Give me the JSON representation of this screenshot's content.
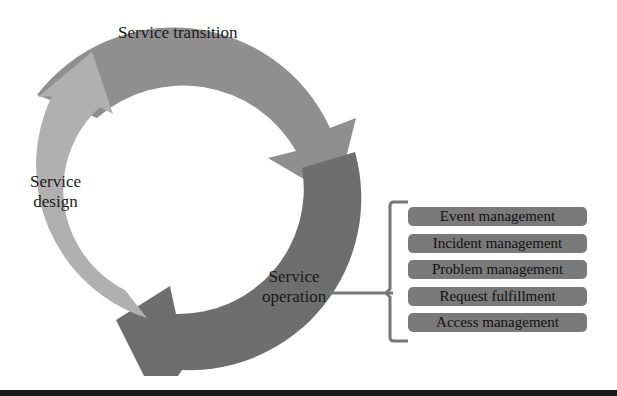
{
  "diagram": {
    "stages": [
      {
        "id": "service-transition",
        "label": "Service transition",
        "color": "#8f8f8f"
      },
      {
        "id": "service-operation",
        "label_line1": "Service",
        "label_line2": "operation",
        "color": "#6e6e6e"
      },
      {
        "id": "service-design",
        "label_line1": "Service",
        "label_line2": "design",
        "color": "#b0b0b0"
      }
    ],
    "operation_processes": [
      "Event management",
      "Incident management",
      "Problem management",
      "Request fulfillment",
      "Access management"
    ],
    "colors": {
      "transition": "#8f8f8f",
      "operation": "#6e6e6e",
      "design": "#b0b0b0",
      "process_box": "#7a7a7a",
      "bracket": "#777777"
    }
  }
}
